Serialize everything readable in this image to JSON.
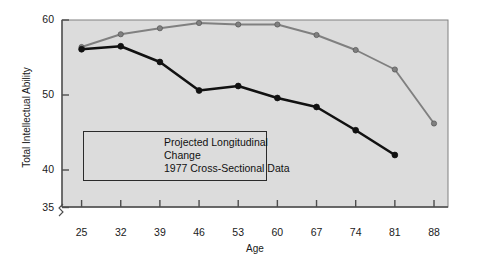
{
  "chart_data": {
    "type": "line",
    "title": "",
    "xlabel": "Age",
    "ylabel": "Total Intellectual Ability",
    "x": [
      25,
      32,
      39,
      46,
      53,
      60,
      67,
      74,
      81,
      88
    ],
    "xticklabels": [
      "25",
      "32",
      "39",
      "46",
      "53",
      "60",
      "67",
      "74",
      "81",
      "88"
    ],
    "yticks": [
      35,
      40,
      50,
      60
    ],
    "yticklabels": [
      "35",
      "40",
      "50",
      "60"
    ],
    "xlim": [
      21.5,
      90.5
    ],
    "ylim": [
      35,
      60
    ],
    "grid": false,
    "axis_break": true,
    "legend_position": "inside-lower-left",
    "series": [
      {
        "name": "Projected Longitudinal Change",
        "color": "#808080",
        "marker": "circle",
        "values": [
          56.4,
          58.1,
          58.9,
          59.6,
          59.4,
          59.4,
          58.0,
          56.0,
          53.4,
          46.2
        ]
      },
      {
        "name": "1977 Cross-Sectional Data",
        "color": "#111111",
        "marker": "circle",
        "values": [
          56.1,
          56.5,
          54.4,
          50.6,
          51.2,
          49.6,
          48.4,
          45.3,
          42.0,
          null
        ]
      }
    ]
  },
  "legend": {
    "items": [
      {
        "label": "Projected Longitudinal\nChange",
        "color": "#808080"
      },
      {
        "label": "1977 Cross-Sectional Data",
        "color": "#111111"
      }
    ]
  },
  "colors": {
    "plot_background": "#dcdcdc",
    "page_background": "#ffffff",
    "axis": "#4d4d4d",
    "series_projected": "#808080",
    "series_cross_sectional": "#111111"
  }
}
